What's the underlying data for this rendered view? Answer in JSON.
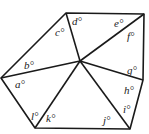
{
  "diagram": {
    "stroke_color": "#1a1a1a",
    "vertices": {
      "top_left": [
        66,
        13
      ],
      "top_right": [
        144,
        14
      ],
      "center": [
        80,
        61
      ],
      "left": [
        1,
        78
      ],
      "right_mid": [
        143,
        80
      ],
      "bottom_left": [
        35,
        128
      ],
      "bottom_right": [
        130,
        129
      ]
    },
    "labels": [
      {
        "id": "a",
        "text": "a°",
        "x": 15,
        "y": 88
      },
      {
        "id": "b",
        "text": "b°",
        "x": 24,
        "y": 69
      },
      {
        "id": "c",
        "text": "c°",
        "x": 55,
        "y": 36
      },
      {
        "id": "d",
        "text": "d°",
        "x": 72,
        "y": 25
      },
      {
        "id": "e",
        "text": "e°",
        "x": 114,
        "y": 27
      },
      {
        "id": "f",
        "text": "f°",
        "x": 127,
        "y": 40
      },
      {
        "id": "g",
        "text": "g°",
        "x": 127,
        "y": 74
      },
      {
        "id": "h",
        "text": "h°",
        "x": 124,
        "y": 94
      },
      {
        "id": "i",
        "text": "i°",
        "x": 123,
        "y": 113
      },
      {
        "id": "j",
        "text": "j°",
        "x": 103,
        "y": 124
      },
      {
        "id": "k",
        "text": "k°",
        "x": 46,
        "y": 122
      },
      {
        "id": "l",
        "text": "l°",
        "x": 31,
        "y": 120
      }
    ]
  }
}
